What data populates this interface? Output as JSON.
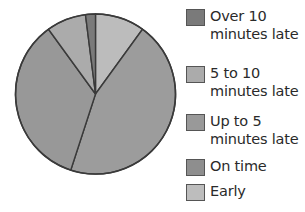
{
  "chart_data": {
    "type": "pie",
    "title": "",
    "start_angle_deg": 0,
    "direction": "clockwise",
    "slices": [
      {
        "label": "Early",
        "value": 10,
        "color": "#bcbcbc"
      },
      {
        "label": "On time",
        "value": 45,
        "color": "#9c9c9c"
      },
      {
        "label": "Up to 5 minutes late",
        "value": 35,
        "color": "#989898"
      },
      {
        "label": "5 to 10 minutes late",
        "value": 8,
        "color": "#ababab"
      },
      {
        "label": "Over 10 minutes late",
        "value": 2,
        "color": "#7a7a7a"
      }
    ],
    "legend_position": "right",
    "legend_entries": [
      "Over 10 minutes late",
      "5 to 10 minutes late",
      "Up to 5 minutes late",
      "On time",
      "Early"
    ]
  },
  "legend": {
    "items": [
      {
        "line1": "Over 10",
        "line2": "minutes late",
        "color": "#7a7a7a"
      },
      {
        "line1": "5 to 10",
        "line2": "minutes late",
        "color": "#ababab"
      },
      {
        "line1": "Up to 5",
        "line2": "minutes late",
        "color": "#999999"
      },
      {
        "line1": "On time",
        "line2": "",
        "color": "#8e8e8e"
      },
      {
        "line1": "Early",
        "line2": "",
        "color": "#bdbdbd"
      }
    ]
  }
}
